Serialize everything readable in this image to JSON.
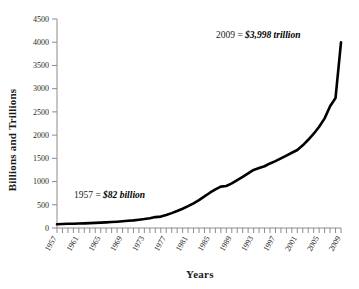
{
  "chart_data": {
    "type": "line",
    "title": "",
    "xlabel": "Years",
    "ylabel": "Billions and Trillions",
    "xlim": [
      1957,
      2009
    ],
    "ylim": [
      0,
      4500
    ],
    "ytick_step": 500,
    "grid": false,
    "legend": null,
    "yticks": [
      "0",
      "500",
      "1000",
      "1500",
      "2000",
      "2500",
      "3000",
      "3500",
      "4000",
      "4500"
    ],
    "xticks": [
      "1957",
      "1961",
      "1965",
      "1969",
      "1973",
      "1977",
      "1981",
      "1985",
      "1989",
      "1993",
      "1997",
      "2001",
      "2005",
      "2009"
    ],
    "x": [
      1957,
      1958,
      1959,
      1960,
      1961,
      1962,
      1963,
      1964,
      1965,
      1966,
      1967,
      1968,
      1969,
      1970,
      1971,
      1972,
      1973,
      1974,
      1975,
      1976,
      1977,
      1978,
      1979,
      1980,
      1981,
      1982,
      1983,
      1984,
      1985,
      1986,
      1987,
      1988,
      1989,
      1990,
      1991,
      1992,
      1993,
      1994,
      1995,
      1996,
      1997,
      1998,
      1999,
      2000,
      2001,
      2002,
      2003,
      2004,
      2005,
      2006,
      2007,
      2008,
      2009
    ],
    "values": [
      82,
      85,
      90,
      93,
      96,
      100,
      105,
      110,
      116,
      122,
      128,
      136,
      145,
      155,
      165,
      178,
      192,
      210,
      235,
      245,
      280,
      320,
      365,
      415,
      470,
      530,
      600,
      680,
      760,
      830,
      890,
      905,
      960,
      1030,
      1100,
      1175,
      1250,
      1290,
      1330,
      1390,
      1440,
      1500,
      1560,
      1620,
      1680,
      1780,
      1900,
      2030,
      2180,
      2360,
      2620,
      2800,
      3998
    ],
    "series_name": "",
    "annotations": [
      {
        "name": "start-value-annotation",
        "prefix": "1957 = ",
        "emphasis": "$82 billion",
        "x": 74,
        "y": 198
      },
      {
        "name": "end-value-annotation",
        "prefix": "2009 = ",
        "emphasis": "$3,998 trillion",
        "x": 216,
        "y": 38
      }
    ],
    "colors": {
      "line": "#000000",
      "axis": "#8c8c8c",
      "text": "#1a1a1a",
      "background": "#ffffff"
    }
  }
}
